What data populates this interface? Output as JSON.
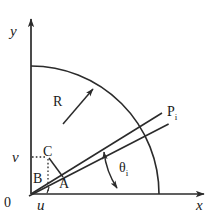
{
  "figure": {
    "background_color": "#ffffff",
    "stroke_color": "#2b2b2b",
    "labels": {
      "y_axis": "y",
      "x_axis": "x",
      "origin": "0",
      "u": "u",
      "v": "v",
      "radius": "R",
      "point_a": "A",
      "point_b": "B",
      "point_c": "C",
      "point_p": "P",
      "point_p_subscript": "i",
      "theta": "θ",
      "theta_subscript": "i"
    },
    "geometry": {
      "origin": [
        31,
        194
      ],
      "y_axis_tip": [
        31,
        14
      ],
      "x_axis_tip": [
        209,
        194
      ],
      "arc_radius": 128,
      "arc_start_on_y": [
        31,
        66
      ],
      "arc_end_on_x": [
        159,
        194
      ],
      "point_p": [
        162,
        113
      ],
      "point_c": [
        48,
        157
      ],
      "point_a": [
        62,
        176
      ],
      "u_foot": [
        48,
        194
      ],
      "v_foot": [
        31,
        157
      ],
      "upper_line_angle_deg": 27.0,
      "lower_line_angle_deg": 36.5,
      "theta_arc_radius": 78
    }
  }
}
